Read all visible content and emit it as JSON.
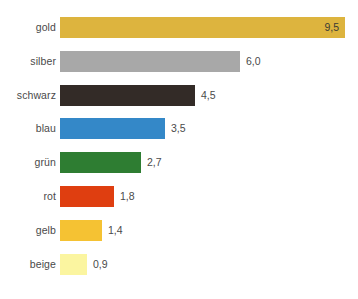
{
  "chart_data": {
    "type": "bar",
    "orientation": "horizontal",
    "title": "",
    "subtitle": "",
    "xlabel": "",
    "ylabel": "",
    "xlim": [
      0,
      9.5
    ],
    "grid": false,
    "legend": "none",
    "decimal_separator": ",",
    "categories": [
      "gold",
      "silber",
      "schwarz",
      "blau",
      "grün",
      "rot",
      "gelb",
      "beige"
    ],
    "values": [
      9.5,
      6.0,
      4.5,
      3.5,
      2.7,
      1.8,
      1.4,
      0.9
    ],
    "value_labels": [
      "9,5",
      "6,0",
      "4,5",
      "3,5",
      "2,7",
      "1,8",
      "1,4",
      "0,9"
    ],
    "bar_colors": [
      "#ddb43e",
      "#a8a8a8",
      "#332b27",
      "#3488c8",
      "#2e7d32",
      "#df3e10",
      "#f5c233",
      "#fbf5a0"
    ],
    "label_positions": [
      "inside",
      "outside",
      "outside",
      "outside",
      "outside",
      "outside",
      "outside",
      "outside"
    ],
    "bars": [
      {
        "category": "gold",
        "value": 9.5,
        "value_label": "9,5",
        "color": "#ddb43e",
        "label_position": "inside",
        "value_text_color": "#3b3b35"
      },
      {
        "category": "silber",
        "value": 6.0,
        "value_label": "6,0",
        "color": "#a8a8a8",
        "label_position": "outside",
        "value_text_color": "#4a4a4a"
      },
      {
        "category": "schwarz",
        "value": 4.5,
        "value_label": "4,5",
        "color": "#332b27",
        "label_position": "outside",
        "value_text_color": "#4a4a4a"
      },
      {
        "category": "blau",
        "value": 3.5,
        "value_label": "3,5",
        "color": "#3488c8",
        "label_position": "outside",
        "value_text_color": "#4a4a4a"
      },
      {
        "category": "grün",
        "value": 2.7,
        "value_label": "2,7",
        "color": "#2e7d32",
        "label_position": "outside",
        "value_text_color": "#4a4a4a"
      },
      {
        "category": "rot",
        "value": 1.8,
        "value_label": "1,8",
        "color": "#df3e10",
        "label_position": "outside",
        "value_text_color": "#4a4a4a"
      },
      {
        "category": "gelb",
        "value": 1.4,
        "value_label": "1,4",
        "color": "#f5c233",
        "label_position": "outside",
        "value_text_color": "#4a4a4a"
      },
      {
        "category": "beige",
        "value": 0.9,
        "value_label": "0,9",
        "color": "#fbf5a0",
        "label_position": "outside",
        "value_text_color": "#4a4a4a"
      }
    ]
  },
  "layout": {
    "bar_origin_x": 60,
    "label_right_x": 56,
    "bar_height": 21,
    "row_pitch": 33.8,
    "first_row_top": 17,
    "px_per_unit": 30.0,
    "background": "#ffffff",
    "label_color": "#4a4a4a"
  }
}
